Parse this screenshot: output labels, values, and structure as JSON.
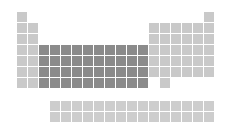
{
  "colors": {
    "main_group": "#c9c9c9",
    "transition": "#8b8b8b",
    "f_block": "#cdcdcd"
  },
  "layout": {
    "origin_x": 17,
    "origin_y": 12,
    "pitch": 11,
    "cell": 10,
    "f_origin_x": 50,
    "f_origin_y": 101
  },
  "rows": [
    {
      "period": 1,
      "light": [
        1,
        18
      ],
      "dark": []
    },
    {
      "period": 2,
      "light": [
        1,
        2,
        13,
        14,
        15,
        16,
        17,
        18
      ],
      "dark": []
    },
    {
      "period": 3,
      "light": [
        1,
        2,
        13,
        14,
        15,
        16,
        17,
        18
      ],
      "dark": []
    },
    {
      "period": 4,
      "light": [
        1,
        2,
        13,
        14,
        15,
        16,
        17,
        18
      ],
      "dark": [
        3,
        4,
        5,
        6,
        7,
        8,
        9,
        10,
        11,
        12
      ]
    },
    {
      "period": 5,
      "light": [
        1,
        2,
        13,
        14,
        15,
        16,
        17,
        18
      ],
      "dark": [
        3,
        4,
        5,
        6,
        7,
        8,
        9,
        10,
        11,
        12
      ]
    },
    {
      "period": 6,
      "light": [
        1,
        2,
        13,
        14,
        15,
        16,
        17,
        18
      ],
      "dark": [
        3,
        4,
        5,
        6,
        7,
        8,
        9,
        10,
        11,
        12
      ]
    },
    {
      "period": 7,
      "light": [
        1,
        2,
        14
      ],
      "dark": [
        3,
        4,
        5,
        6,
        7,
        8,
        9,
        10,
        11,
        12
      ]
    }
  ],
  "f_block": {
    "rows": 2,
    "columns": 15
  }
}
